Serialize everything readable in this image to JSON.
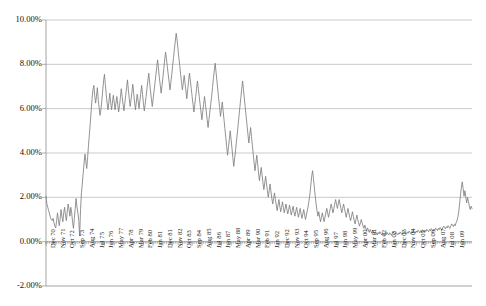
{
  "chart_data": {
    "type": "line",
    "title": "",
    "subtitle": "",
    "xlabel": "",
    "ylabel": "",
    "ylim": [
      -2.0,
      10.0
    ],
    "y_ticks": [
      10.0,
      8.0,
      6.0,
      4.0,
      2.0,
      0.0,
      -2.0
    ],
    "y_tick_labels": [
      "10.00%",
      "8.00%",
      "6.00%",
      "4.00%",
      "2.00%",
      "0.00%",
      "-2.00%"
    ],
    "grid": true,
    "legend": "none",
    "line_color": "#7f7f7f",
    "gridline_color": "#b4b4b4",
    "axis_color": "#8e8e8e",
    "background_color": "#ffffff",
    "x_start": "Dec 70",
    "x_end": "Jun 09",
    "x_tick_interval_months": 11,
    "x_tick_labels": [
      "Dec 70",
      "Nov 71",
      "Oct 72",
      "Sep 73",
      "Aug 74",
      "Jul 75",
      "Jun 76",
      "May 77",
      "Apr 78",
      "Mar 79",
      "Feb 80",
      "Jan 81",
      "Dec 81",
      "Nov 82",
      "Oct 83",
      "Sep 84",
      "Aug 85",
      "Jul 86",
      "Jun 87",
      "May 88",
      "Apr 89",
      "Mar 90",
      "Feb 91",
      "Jan 92",
      "Dec 92",
      "Nov 93",
      "Oct 94",
      "Sep 95",
      "Aug 96",
      "Jul 97",
      "Jun 98",
      "May 99",
      "Apr 00",
      "Mar 01",
      "Feb 02",
      "Jan 03",
      "Dec 03",
      "Nov 04",
      "Oct 05",
      "Sep 06",
      "Aug 07",
      "Jul 08",
      "Jun 09"
    ],
    "values": [
      2.05,
      1.7,
      1.55,
      1.4,
      1.25,
      1.1,
      1.0,
      0.95,
      1.05,
      0.85,
      0.7,
      0.62,
      0.95,
      1.3,
      0.98,
      0.72,
      1.05,
      1.45,
      1.12,
      0.9,
      1.3,
      1.55,
      1.2,
      0.95,
      1.35,
      1.7,
      1.45,
      1.15,
      1.55,
      1.3,
      0.9,
      0.6,
      1.05,
      1.5,
      1.95,
      1.55,
      1.3,
      0.95,
      0.25,
      1.45,
      2.2,
      2.6,
      3.1,
      3.55,
      3.95,
      3.6,
      3.3,
      3.8,
      4.35,
      4.85,
      5.35,
      5.9,
      6.45,
      6.85,
      7.05,
      6.6,
      6.25,
      6.55,
      6.95,
      6.4,
      6.05,
      5.7,
      5.95,
      6.35,
      6.8,
      7.25,
      7.55,
      7.1,
      6.65,
      6.25,
      5.95,
      6.3,
      6.7,
      6.3,
      5.95,
      6.25,
      6.6,
      6.3,
      5.95,
      6.25,
      6.55,
      6.2,
      5.85,
      6.15,
      6.5,
      6.9,
      6.55,
      6.2,
      5.9,
      6.25,
      6.6,
      6.95,
      7.3,
      6.85,
      6.45,
      6.1,
      6.4,
      6.75,
      7.1,
      6.7,
      6.3,
      5.95,
      6.3,
      6.65,
      6.35,
      6.0,
      6.35,
      6.7,
      7.05,
      6.65,
      6.25,
      5.9,
      6.2,
      6.55,
      6.9,
      7.25,
      7.6,
      7.2,
      6.8,
      6.45,
      6.1,
      6.45,
      6.8,
      7.15,
      7.5,
      7.85,
      8.2,
      7.8,
      7.4,
      7.05,
      6.7,
      7.05,
      7.4,
      7.8,
      8.2,
      8.55,
      8.25,
      7.9,
      7.55,
      7.2,
      6.85,
      7.2,
      7.55,
      7.95,
      8.3,
      8.7,
      9.05,
      9.4,
      9.1,
      8.7,
      8.3,
      7.95,
      7.55,
      7.2,
      6.85,
      7.15,
      7.5,
      7.15,
      6.8,
      6.45,
      6.85,
      7.25,
      7.6,
      7.25,
      6.9,
      6.55,
      6.2,
      5.85,
      6.2,
      6.55,
      6.9,
      7.25,
      6.9,
      6.55,
      6.2,
      5.85,
      5.5,
      5.85,
      6.2,
      6.55,
      6.2,
      5.85,
      5.5,
      5.15,
      5.5,
      5.85,
      6.2,
      6.55,
      6.95,
      7.35,
      7.7,
      8.05,
      7.65,
      7.25,
      6.85,
      6.45,
      6.05,
      5.65,
      5.95,
      6.3,
      5.9,
      5.5,
      5.1,
      4.7,
      4.3,
      3.9,
      4.25,
      4.6,
      5.0,
      4.6,
      4.2,
      3.8,
      3.4,
      3.75,
      4.1,
      4.5,
      4.9,
      5.3,
      5.7,
      6.1,
      6.5,
      6.9,
      7.25,
      6.85,
      6.45,
      6.05,
      5.65,
      5.25,
      4.85,
      4.45,
      4.8,
      5.15,
      4.75,
      4.35,
      3.95,
      3.55,
      3.2,
      3.55,
      3.9,
      3.5,
      3.1,
      2.75,
      3.05,
      3.35,
      3.0,
      2.65,
      2.35,
      2.65,
      2.95,
      2.6,
      2.3,
      2.0,
      2.3,
      2.6,
      2.25,
      1.95,
      1.7,
      1.95,
      2.2,
      1.9,
      1.65,
      1.4,
      1.65,
      1.9,
      1.6,
      1.35,
      1.55,
      1.8,
      1.55,
      1.3,
      1.5,
      1.7,
      1.45,
      1.25,
      1.45,
      1.65,
      1.4,
      1.2,
      1.4,
      1.6,
      1.35,
      1.15,
      1.35,
      1.55,
      1.3,
      1.1,
      1.3,
      1.5,
      1.25,
      1.05,
      1.25,
      1.45,
      1.2,
      1.0,
      1.2,
      1.4,
      1.6,
      1.85,
      2.15,
      2.55,
      2.95,
      3.2,
      2.85,
      2.45,
      2.05,
      1.7,
      1.4,
      1.15,
      1.35,
      1.1,
      0.9,
      1.1,
      1.3,
      1.1,
      0.9,
      1.1,
      1.3,
      1.5,
      1.3,
      1.1,
      1.3,
      1.5,
      1.7,
      1.5,
      1.3,
      1.5,
      1.7,
      1.9,
      1.7,
      1.5,
      1.7,
      1.9,
      1.7,
      1.5,
      1.3,
      1.5,
      1.7,
      1.5,
      1.3,
      1.1,
      1.3,
      1.5,
      1.3,
      1.1,
      0.95,
      1.15,
      1.35,
      1.15,
      0.95,
      0.8,
      1.0,
      1.2,
      1.0,
      0.85,
      0.7,
      0.85,
      1.0,
      0.85,
      0.7,
      0.6,
      0.75,
      0.6,
      0.5,
      0.62,
      0.52,
      0.42,
      0.55,
      0.45,
      0.38,
      0.5,
      0.42,
      0.35,
      0.45,
      0.38,
      0.3,
      0.42,
      0.35,
      0.45,
      0.38,
      0.3,
      0.4,
      0.33,
      0.28,
      0.38,
      0.32,
      0.42,
      0.35,
      0.3,
      0.4,
      0.34,
      0.28,
      0.38,
      0.45,
      0.38,
      0.32,
      0.42,
      0.36,
      0.3,
      0.4,
      0.34,
      0.44,
      0.38,
      0.32,
      0.42,
      0.36,
      0.46,
      0.4,
      0.34,
      0.44,
      0.38,
      0.48,
      0.42,
      0.36,
      0.46,
      0.4,
      0.5,
      0.44,
      0.38,
      0.48,
      0.42,
      0.52,
      0.46,
      0.4,
      0.5,
      0.44,
      0.54,
      0.48,
      0.42,
      0.52,
      0.46,
      0.56,
      0.5,
      0.45,
      0.55,
      0.49,
      0.59,
      0.53,
      0.47,
      0.57,
      0.51,
      0.61,
      0.55,
      0.5,
      0.6,
      0.54,
      0.64,
      0.58,
      0.52,
      0.62,
      0.7,
      0.64,
      0.58,
      0.68,
      0.62,
      0.72,
      0.66,
      0.6,
      0.7,
      0.8,
      0.74,
      0.68,
      0.78,
      0.72,
      0.85,
      0.95,
      1.1,
      1.35,
      1.7,
      2.1,
      2.45,
      2.7,
      2.4,
      2.05,
      2.3,
      2.0,
      1.75,
      2.0,
      1.8,
      1.6,
      1.45,
      1.6,
      1.5
    ]
  }
}
